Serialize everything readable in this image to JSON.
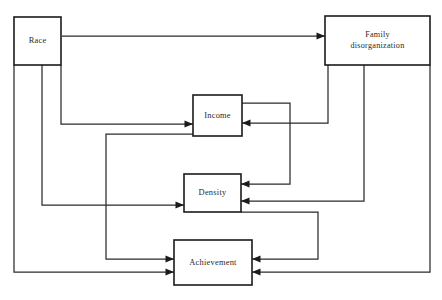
{
  "diagram": {
    "type": "path-diagram",
    "canvas": {
      "width": 442,
      "height": 300,
      "background": "#ffffff"
    },
    "style": {
      "line_color": "#2b2b2b",
      "box_stroke": "#1b1b1b",
      "box_fill": "#ffffff",
      "text_color": "#2a2a2a"
    },
    "nodes": [
      {
        "id": "race",
        "label": "Race",
        "label_lines": [
          "Race"
        ],
        "x": 14,
        "y": 17,
        "width": 47,
        "height": 48
      },
      {
        "id": "family_disorganization",
        "label": "Family disorganization",
        "label_lines": [
          "Family",
          "disorganization"
        ],
        "x": 325,
        "y": 16,
        "width": 105,
        "height": 49
      },
      {
        "id": "income",
        "label": "Income",
        "label_lines": [
          "Income"
        ],
        "x": 193,
        "y": 95,
        "width": 49,
        "height": 41
      },
      {
        "id": "density",
        "label": "Density",
        "label_lines": [
          "Density"
        ],
        "x": 184,
        "y": 174,
        "width": 57,
        "height": 38
      },
      {
        "id": "achievement",
        "label": "Achievement",
        "label_lines": [
          "Achievement"
        ],
        "x": 174,
        "y": 240,
        "width": 78,
        "height": 45
      }
    ],
    "edges": [
      {
        "id": "race-to-family",
        "from": "race",
        "to": "family_disorganization",
        "path": "M 62 36 L 325 36",
        "arrow": {
          "x": 325,
          "y": 36,
          "dir": "right"
        }
      },
      {
        "id": "race-to-income",
        "from": "race",
        "to": "income",
        "path": "M 61 65 L 61 124 L 193 124",
        "arrow": {
          "x": 193,
          "y": 124,
          "dir": "right"
        }
      },
      {
        "id": "race-to-density",
        "from": "race",
        "to": "density",
        "path": "M 42 65 L 42 205 L 184 205",
        "arrow": {
          "x": 184,
          "y": 205,
          "dir": "right"
        }
      },
      {
        "id": "race-to-achievement",
        "from": "race",
        "to": "achievement",
        "path": "M 14 65 L 14 272 L 174 272",
        "arrow": {
          "x": 174,
          "y": 272,
          "dir": "right"
        }
      },
      {
        "id": "family-to-income",
        "from": "family_disorganization",
        "to": "income",
        "path": "M 328 65 L 328 123 L 242 123",
        "arrow": {
          "x": 242,
          "y": 123,
          "dir": "left"
        }
      },
      {
        "id": "family-to-density",
        "from": "family_disorganization",
        "to": "density",
        "path": "M 364 65 L 364 201 L 241 201",
        "arrow": {
          "x": 241,
          "y": 201,
          "dir": "left"
        }
      },
      {
        "id": "family-to-achievement",
        "from": "family_disorganization",
        "to": "achievement",
        "path": "M 430 65 L 430 272 L 252 272",
        "arrow": {
          "x": 252,
          "y": 272,
          "dir": "left"
        }
      },
      {
        "id": "income-to-density",
        "from": "income",
        "to": "density",
        "path": "M 242 103 L 290 103 L 290 184 L 241 184",
        "arrow": {
          "x": 241,
          "y": 184,
          "dir": "left"
        }
      },
      {
        "id": "income-to-achievement",
        "from": "income",
        "to": "achievement",
        "path": "M 193 134 L 106 134 L 106 259 L 174 259",
        "arrow": {
          "x": 174,
          "y": 259,
          "dir": "right"
        }
      },
      {
        "id": "density-to-achievement",
        "from": "density",
        "to": "achievement",
        "path": "M 241 212 L 318 212 L 318 259 L 252 259",
        "arrow": {
          "x": 252,
          "y": 259,
          "dir": "left"
        }
      }
    ]
  }
}
